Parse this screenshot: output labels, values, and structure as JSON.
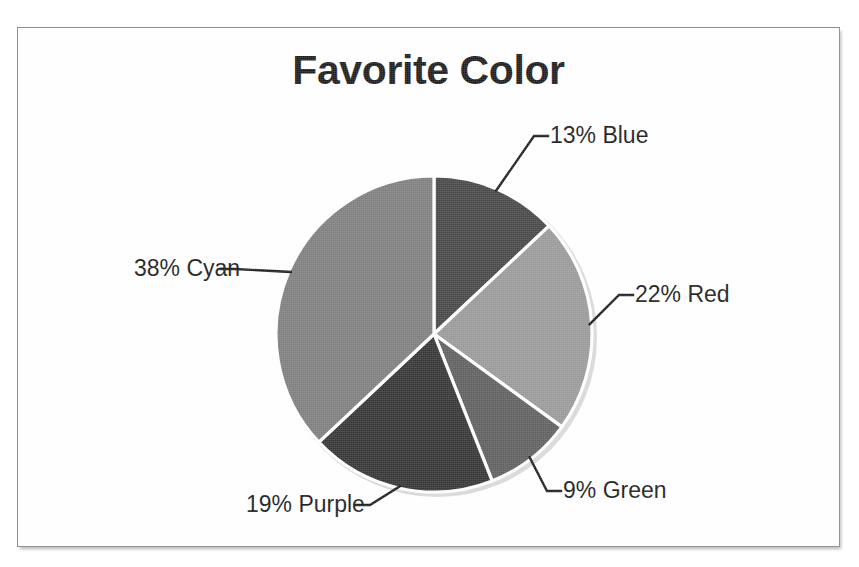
{
  "scan": {
    "top_clipped_text": "",
    "frame_color": "#8e8e8e",
    "page_background": "#ffffff"
  },
  "chart_data": {
    "type": "pie",
    "title": "Favorite Color",
    "xlabel": "",
    "ylabel": "",
    "legend_position": "none",
    "label_format": "{percent}% {name}",
    "start_angle_deg": 0,
    "direction": "clockwise",
    "categories": [
      "Blue",
      "Red",
      "Green",
      "Purple",
      "Cyan"
    ],
    "values": [
      13,
      22,
      9,
      19,
      38
    ],
    "slices": [
      {
        "name": "Blue",
        "percent": 13,
        "label": "13% Blue",
        "fill": "#454545",
        "start_deg": 0,
        "end_deg": 46.8,
        "label_x": 532,
        "label_y": 115
      },
      {
        "name": "Red",
        "percent": 22,
        "label": "22% Red",
        "fill": "#989898",
        "start_deg": 46.8,
        "end_deg": 126.0,
        "label_x": 617,
        "label_y": 274
      },
      {
        "name": "Green",
        "percent": 9,
        "label": "9% Green",
        "fill": "#5e5e5e",
        "start_deg": 126.0,
        "end_deg": 158.4,
        "label_x": 545,
        "label_y": 470
      },
      {
        "name": "Purple",
        "percent": 19,
        "label": "19% Purple",
        "fill": "#333333",
        "start_deg": 158.4,
        "end_deg": 226.8,
        "label_x": 228,
        "label_y": 484
      },
      {
        "name": "Cyan",
        "percent": 38,
        "label": "38% Cyan",
        "fill": "#7d7d7d",
        "start_deg": 226.8,
        "end_deg": 360.0,
        "label_x": 116,
        "label_y": 248
      }
    ],
    "total_percent": 101,
    "center_x": 416,
    "center_y": 306,
    "radius": 158
  }
}
